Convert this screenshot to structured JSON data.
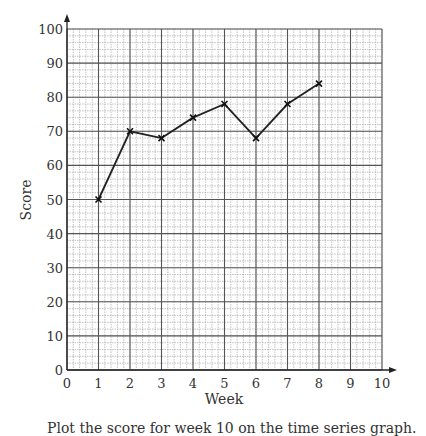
{
  "chart_data": {
    "type": "line",
    "title": "",
    "xlabel": "Week",
    "ylabel": "Score",
    "x": [
      1,
      2,
      3,
      4,
      5,
      6,
      7,
      8
    ],
    "values": [
      50,
      70,
      68,
      74,
      78,
      68,
      78,
      84
    ],
    "xlim": [
      0,
      10
    ],
    "ylim": [
      0,
      100
    ],
    "xticks": [
      0,
      1,
      2,
      3,
      4,
      5,
      6,
      7,
      8,
      9,
      10
    ],
    "yticks": [
      0,
      10,
      20,
      30,
      40,
      50,
      60,
      70,
      80,
      90,
      100
    ],
    "grid": true,
    "marker": "cross",
    "legend": null
  },
  "caption": "Plot the score for week 10 on the time series graph."
}
